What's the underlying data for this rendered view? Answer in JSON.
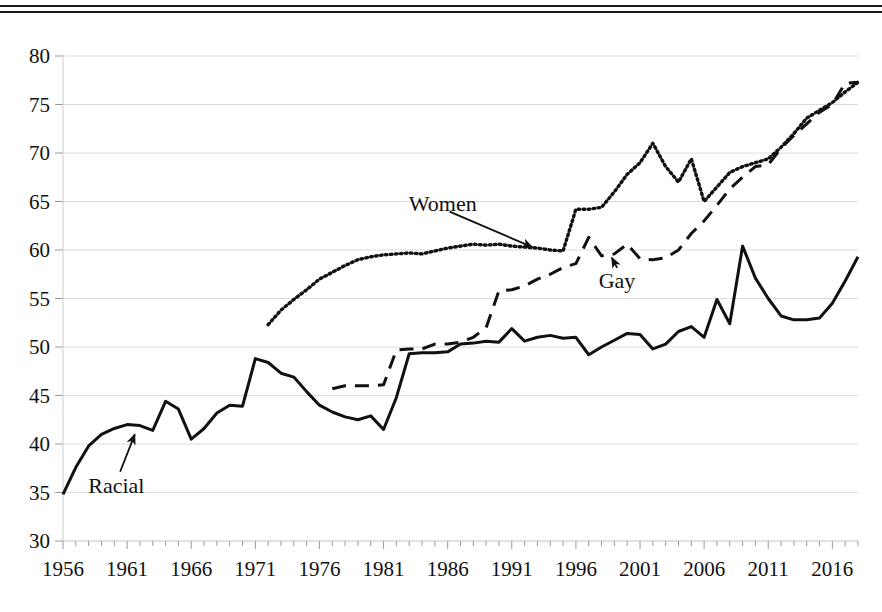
{
  "chart_data": {
    "type": "line",
    "title": "",
    "subtitle": "",
    "xlabel": "",
    "ylabel": "",
    "xlim": [
      1956,
      2018
    ],
    "ylim": [
      30,
      80
    ],
    "grid": true,
    "legend_position": "inline-annotations",
    "y_ticks": [
      30,
      35,
      40,
      45,
      50,
      55,
      60,
      65,
      70,
      75,
      80
    ],
    "x_ticks": [
      1956,
      1961,
      1966,
      1971,
      1976,
      1981,
      1986,
      1991,
      1996,
      2001,
      2006,
      2011,
      2016
    ],
    "x_tick_minor_step": 1,
    "annotations": [
      {
        "text": "Racial",
        "label_x": 1960.0,
        "label_y": 35.6,
        "arrow_to_x": 1961.6,
        "arrow_to_y": 41.0
      },
      {
        "text": "Women",
        "label_x": 1985.0,
        "label_y": 64.6,
        "arrow_to_x": 1992.6,
        "arrow_to_y": 60.3
      },
      {
        "text": "Gay",
        "label_x": 1999.8,
        "label_y": 56.7,
        "arrow_to_x": 1998.8,
        "arrow_to_y": 59.2
      }
    ],
    "series": [
      {
        "name": "Racial",
        "style": "solid",
        "color": "#111111",
        "x": [
          1956,
          1957,
          1958,
          1959,
          1960,
          1961,
          1962,
          1963,
          1964,
          1965,
          1966,
          1967,
          1968,
          1969,
          1970,
          1971,
          1972,
          1973,
          1974,
          1975,
          1976,
          1977,
          1978,
          1979,
          1980,
          1981,
          1982,
          1983,
          1984,
          1985,
          1986,
          1987,
          1988,
          1989,
          1990,
          1991,
          1992,
          1993,
          1994,
          1995,
          1996,
          1997,
          1998,
          1999,
          2000,
          2001,
          2002,
          2003,
          2004,
          2005,
          2006,
          2007,
          2008,
          2009,
          2010,
          2011,
          2012,
          2013,
          2014,
          2015,
          2016,
          2017,
          2018
        ],
        "y": [
          34.8,
          37.6,
          39.8,
          41.0,
          41.6,
          42.0,
          41.9,
          41.4,
          44.4,
          43.6,
          40.5,
          41.6,
          43.2,
          44.0,
          43.9,
          48.8,
          48.4,
          47.3,
          46.9,
          45.4,
          44.0,
          43.3,
          42.8,
          42.5,
          42.9,
          41.5,
          44.8,
          49.3,
          49.4,
          49.4,
          49.5,
          50.3,
          50.4,
          50.6,
          50.5,
          51.9,
          50.6,
          51.0,
          51.2,
          50.9,
          51.0,
          49.2,
          50.0,
          50.7,
          51.4,
          51.3,
          49.8,
          50.3,
          51.6,
          52.1,
          51.0,
          54.9,
          52.4,
          60.4,
          57.1,
          55.0,
          53.2,
          52.8,
          52.8,
          53.0,
          54.5,
          56.8,
          59.3
        ]
      },
      {
        "name": "Gay",
        "style": "dashed",
        "color": "#111111",
        "x": [
          1977,
          1978,
          1979,
          1980,
          1981,
          1982,
          1983,
          1984,
          1985,
          1986,
          1987,
          1988,
          1989,
          1990,
          1991,
          1992,
          1993,
          1994,
          1995,
          1996,
          1997,
          1998,
          1999,
          2000,
          2001,
          2002,
          2003,
          2004,
          2005,
          2006,
          2007,
          2008,
          2009,
          2010,
          2011,
          2012,
          2013,
          2014,
          2015,
          2016,
          2017,
          2018
        ],
        "y": [
          45.7,
          46.0,
          46.0,
          46.0,
          46.1,
          49.7,
          49.8,
          49.8,
          50.3,
          50.3,
          50.5,
          51.0,
          52.0,
          55.8,
          55.9,
          56.3,
          57.0,
          57.5,
          58.2,
          58.6,
          61.3,
          59.4,
          59.6,
          60.6,
          59.1,
          59.0,
          59.2,
          60.0,
          61.7,
          63.0,
          64.6,
          66.3,
          67.5,
          68.6,
          68.8,
          70.5,
          71.8,
          73.0,
          74.2,
          75.0,
          77.2,
          77.3
        ]
      },
      {
        "name": "Women",
        "style": "dotted",
        "color": "#111111",
        "x": [
          1972,
          1973,
          1974,
          1975,
          1976,
          1977,
          1978,
          1979,
          1980,
          1981,
          1982,
          1983,
          1984,
          1985,
          1986,
          1987,
          1988,
          1989,
          1990,
          1991,
          1992,
          1993,
          1994,
          1995,
          1996,
          1997,
          1998,
          1999,
          2000,
          2001,
          2002,
          2003,
          2004,
          2005,
          2006,
          2007,
          2008,
          2009,
          2010,
          2011,
          2012,
          2013,
          2014,
          2015,
          2016,
          2017,
          2018
        ],
        "y": [
          52.3,
          53.8,
          54.9,
          55.9,
          57.0,
          57.7,
          58.4,
          59.0,
          59.3,
          59.5,
          59.6,
          59.7,
          59.6,
          59.9,
          60.2,
          60.4,
          60.6,
          60.5,
          60.6,
          60.4,
          60.3,
          60.2,
          60.0,
          59.9,
          64.2,
          64.2,
          64.4,
          66.0,
          67.8,
          69.0,
          71.0,
          68.6,
          67.0,
          69.4,
          65.0,
          66.5,
          68.0,
          68.6,
          69.0,
          69.4,
          70.6,
          72.0,
          73.6,
          74.4,
          75.2,
          76.3,
          77.3
        ]
      }
    ]
  },
  "axis": {
    "y_labels": [
      "80",
      "75",
      "70",
      "65",
      "60",
      "55",
      "50",
      "45",
      "40",
      "35",
      "30"
    ],
    "x_labels": [
      "1956",
      "1961",
      "1966",
      "1971",
      "1976",
      "1981",
      "1986",
      "1991",
      "1996",
      "2001",
      "2006",
      "2011",
      "2016"
    ]
  },
  "annotations": {
    "racial": "Racial",
    "women": "Women",
    "gay": "Gay"
  },
  "colors": {
    "ink": "#111111",
    "grid": "#dcdcdc",
    "rule": "#1a1a1a",
    "background": "#ffffff"
  }
}
